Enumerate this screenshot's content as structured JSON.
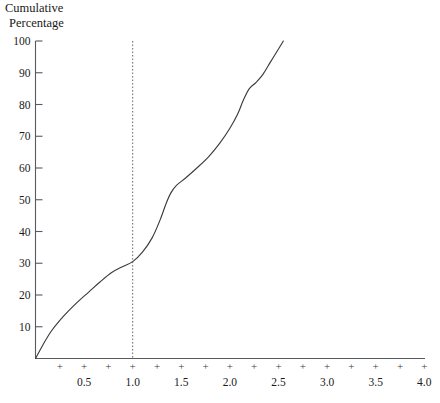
{
  "chart_data": {
    "type": "line",
    "title": "Cumulative Percentage",
    "title_line1": "Cumulative",
    "title_line2": "Percentage",
    "xlabel": "",
    "ylabel": "Cumulative Percentage",
    "xlim": [
      0,
      4.0
    ],
    "ylim": [
      0,
      100
    ],
    "grid": false,
    "legend": null,
    "x_tick_labels": [
      "0.5",
      "1.0",
      "1.5",
      "2.0",
      "2.5",
      "3.0",
      "3.5",
      "4.0"
    ],
    "x_tick_values": [
      0.5,
      1.0,
      1.5,
      2.0,
      2.5,
      3.0,
      3.5,
      4.0
    ],
    "x_minor_tick_values": [
      0.25,
      0.5,
      0.75,
      1.0,
      1.25,
      1.5,
      1.75,
      2.0,
      2.25,
      2.5,
      2.75,
      3.0,
      3.25,
      3.5,
      3.75,
      4.0
    ],
    "x_tick_glyph": "+",
    "y_tick_labels": [
      "10",
      "20",
      "30",
      "40",
      "50",
      "60",
      "70",
      "80",
      "90",
      "100"
    ],
    "y_tick_values": [
      10,
      20,
      30,
      40,
      50,
      60,
      70,
      80,
      90,
      100
    ],
    "annotations": [
      {
        "name": "reference-line-at-1.0",
        "type": "vertical-dashed-line",
        "x": 1.0,
        "label": ""
      }
    ],
    "series": [
      {
        "name": "cumulative-ogive",
        "color": "#3c3c3c",
        "x": [
          0.0,
          0.08,
          0.16,
          0.25,
          0.34,
          0.44,
          0.55,
          0.66,
          0.78,
          0.9,
          1.0,
          1.1,
          1.2,
          1.28,
          1.34,
          1.39,
          1.45,
          1.55,
          1.66,
          1.78,
          1.9,
          2.0,
          2.08,
          2.14,
          2.2,
          2.27,
          2.34,
          2.42,
          2.5,
          2.55
        ],
        "y": [
          0.0,
          4.5,
          8.5,
          12.0,
          15.0,
          18.0,
          21.0,
          24.0,
          27.0,
          29.0,
          30.5,
          33.5,
          38.0,
          43.5,
          48.5,
          52.0,
          54.5,
          57.0,
          60.0,
          63.5,
          68.0,
          72.5,
          77.0,
          81.5,
          85.0,
          87.0,
          89.5,
          93.5,
          97.5,
          100.0
        ]
      }
    ],
    "colors": {
      "curve": "#3c3c3c",
      "axis": "#555b5e",
      "reference_line": "#6b6b6b",
      "text": "#1a1a1a",
      "background": "#ffffff"
    }
  }
}
